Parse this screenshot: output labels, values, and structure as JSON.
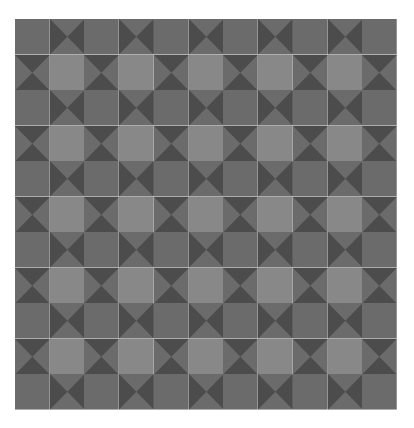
{
  "pattern": {
    "name": "hourglass-quilt-pattern",
    "rows": 11,
    "cols": 11,
    "colors": {
      "medium": "#6b6b6b",
      "dark": "#4c4c4c",
      "light": "#888888",
      "background": "#ffffff"
    },
    "tile_rules": {
      "even_row_even_col": "plain",
      "odd_row_odd_col": "light-square",
      "even_row_odd_col": "hourglass-horizontal",
      "odd_row_even_col": "hourglass-vertical"
    }
  }
}
